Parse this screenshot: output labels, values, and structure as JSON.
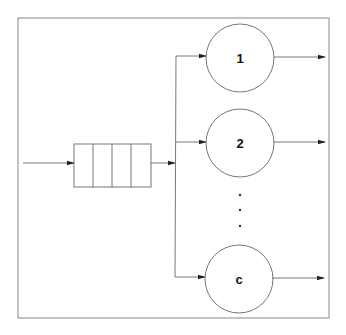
{
  "diagram": {
    "type": "multi-server queue (M/M/c)",
    "colors": {
      "stroke": "#777777",
      "frame": "#888888",
      "arrow": "#222222",
      "text": "#111111",
      "background": "#ffffff"
    },
    "queue": {
      "slots": 4
    },
    "servers": [
      {
        "label": "1"
      },
      {
        "label": "2"
      },
      {
        "label": "c"
      }
    ],
    "ellipsis": "⋮"
  }
}
